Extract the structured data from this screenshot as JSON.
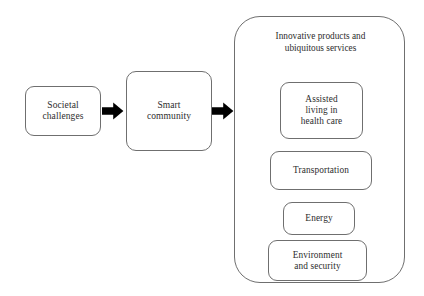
{
  "diagram": {
    "background_color": "#ffffff",
    "stroke_color": "#6f6f6f",
    "text_color": "#2d2d2d",
    "arrow_color": "#000000",
    "flow": [
      {
        "id": "societal-challenges",
        "label": "Societal\nchallenges"
      },
      {
        "id": "smart-community",
        "label": "Smart\ncommunity"
      },
      {
        "id": "innovative-products",
        "label": "Innovative products and\nubiquitous services"
      }
    ],
    "arrows": [
      {
        "id": "arrow-one",
        "icon": "right-arrow-icon",
        "from": "societal-challenges",
        "to": "smart-community"
      },
      {
        "id": "arrow-two",
        "icon": "right-arrow-icon",
        "from": "smart-community",
        "to": "innovative-products"
      }
    ],
    "container": {
      "title": "Innovative products and\nubiquitous services",
      "items": [
        {
          "id": "assisted-living",
          "label": "Assisted\nliving in\nhealth care"
        },
        {
          "id": "transportation",
          "label": "Transportation"
        },
        {
          "id": "energy",
          "label": "Energy"
        },
        {
          "id": "environment-security",
          "label": "Environment\nand security"
        }
      ]
    }
  }
}
